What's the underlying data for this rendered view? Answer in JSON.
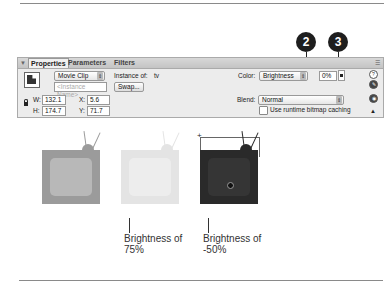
{
  "callouts": [
    {
      "number": "2",
      "target": "color-dropdown"
    },
    {
      "number": "3",
      "target": "brightness-stepper"
    }
  ],
  "panel": {
    "tabs": [
      {
        "label": "Properties",
        "active": true
      },
      {
        "label": "Parameters",
        "active": false
      },
      {
        "label": "Filters",
        "active": false
      }
    ],
    "symbol_type": "Movie Clip",
    "instance_name_placeholder": "<Instance Name>",
    "instance_of_label": "Instance of:",
    "instance_of_value": "tv",
    "swap_button": "Swap...",
    "w_label": "W:",
    "w_value": "132.1",
    "h_label": "H:",
    "h_value": "174.7",
    "x_label": "X:",
    "x_value": "5.6",
    "y_label": "Y:",
    "y_value": "71.7",
    "color_label": "Color:",
    "color_value": "Brightness",
    "brightness_value": "0%",
    "blend_label": "Blend:",
    "blend_value": "Normal",
    "bitmap_caching_label": "Use runtime bitmap caching",
    "bitmap_caching_checked": false,
    "side_icons": [
      "help-icon",
      "edit-icon",
      "accessibility-icon",
      "collapse-arrow-icon"
    ]
  },
  "examples": [
    {
      "label_line1": "",
      "label_line2": "",
      "brightness": "original",
      "body_color": "#9b9b9b",
      "screen_color": "#b8b8b8"
    },
    {
      "label_line1": "Brightness of",
      "label_line2": "75%",
      "brightness": "75%",
      "body_color": "#e4e4e4",
      "screen_color": "#ededed"
    },
    {
      "label_line1": "Brightness of",
      "label_line2": "-50%",
      "brightness": "-50%",
      "body_color": "#2a2a2a",
      "screen_color": "#353535"
    }
  ]
}
